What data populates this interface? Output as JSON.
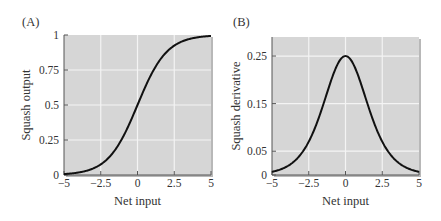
{
  "chart_data": [
    {
      "panel_label": "(A)",
      "type": "line",
      "title": "",
      "xlabel": "Net input",
      "ylabel": "Squash output",
      "xlim": [
        -5,
        5
      ],
      "ylim": [
        0,
        1
      ],
      "xticks": [
        "-5",
        "-2.5",
        "0",
        "2.5",
        "5"
      ],
      "xtick_values": [
        -5,
        -2.5,
        0,
        2.5,
        5
      ],
      "yticks": [
        "0",
        "0.25",
        "0.5",
        "0.75",
        "1"
      ],
      "ytick_values": [
        0,
        0.25,
        0.5,
        0.75,
        1
      ],
      "grid": true,
      "function": "sigmoid",
      "series": [
        {
          "name": "Squash output",
          "x": [
            -5,
            -4,
            -3,
            -2,
            -1,
            0,
            1,
            2,
            3,
            4,
            5
          ],
          "y": [
            0.007,
            0.018,
            0.047,
            0.119,
            0.269,
            0.5,
            0.731,
            0.881,
            0.953,
            0.982,
            0.993
          ]
        }
      ]
    },
    {
      "panel_label": "(B)",
      "type": "line",
      "title": "",
      "xlabel": "Net input",
      "ylabel": "Squash derivative",
      "xlim": [
        -5,
        5
      ],
      "ylim": [
        0,
        0.29
      ],
      "xticks": [
        "-5",
        "-2.5",
        "0",
        "2.5",
        "5"
      ],
      "xtick_values": [
        -5,
        -2.5,
        0,
        2.5,
        5
      ],
      "yticks": [
        "0",
        "0.05",
        "0.15",
        "0.25"
      ],
      "ytick_values": [
        0,
        0.05,
        0.15,
        0.25
      ],
      "grid": true,
      "function": "sigmoid derivative",
      "series": [
        {
          "name": "Squash derivative",
          "x": [
            -5,
            -4,
            -3,
            -2,
            -1,
            0,
            1,
            2,
            3,
            4,
            5
          ],
          "y": [
            0.0066,
            0.0177,
            0.0452,
            0.105,
            0.197,
            0.25,
            0.197,
            0.105,
            0.0452,
            0.0177,
            0.0066
          ]
        }
      ]
    }
  ],
  "colors": {
    "plot_bg": "#d6d6d6",
    "grid": "#f4f4f4",
    "curve": "#111111",
    "axis": "#555555"
  }
}
